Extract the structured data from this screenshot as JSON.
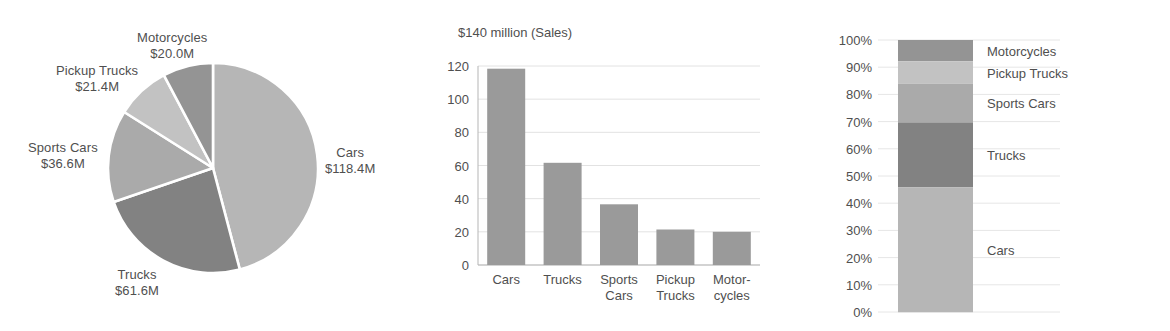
{
  "chart_data": [
    {
      "type": "pie",
      "name": "sales-by-category-pie",
      "title": "",
      "unit": "$M",
      "total": 258.0,
      "categories": [
        "Cars",
        "Trucks",
        "Sports Cars",
        "Pickup Trucks",
        "Motorcycles"
      ],
      "values": [
        118.4,
        61.6,
        36.6,
        21.4,
        20.0
      ],
      "labels": [
        {
          "name": "Cars",
          "value": "$118.4M",
          "color": "#b6b6b6"
        },
        {
          "name": "Trucks",
          "value": "$61.6M",
          "color": "#828282"
        },
        {
          "name": "Sports Cars",
          "value": "$36.6M",
          "color": "#aaaaaa"
        },
        {
          "name": "Pickup Trucks",
          "value": "$21.4M",
          "color": "#c2c2c2"
        },
        {
          "name": "Motorcycles",
          "value": "$20.0M",
          "color": "#949494"
        }
      ],
      "slice_separator_color": "#ffffff",
      "legend": "labels-outside"
    },
    {
      "type": "bar",
      "name": "sales-by-category-bar",
      "title": "$140 million (Sales)",
      "xlabel": "",
      "ylabel": "",
      "ylim": [
        0,
        120
      ],
      "yticks": [
        "0",
        "20",
        "40",
        "60",
        "80",
        "100",
        "120"
      ],
      "grid": true,
      "bar_color": "#9a9a9a",
      "categories": [
        "Cars",
        "Trucks",
        "Sports Cars",
        "Pickup Trucks",
        "Motorcycles"
      ],
      "category_lines": [
        [
          "Cars",
          ""
        ],
        [
          "Trucks",
          ""
        ],
        [
          "Sports",
          "Cars"
        ],
        [
          "Pickup",
          "Trucks"
        ],
        [
          "Motor-",
          "cycles"
        ]
      ],
      "values": [
        118.4,
        61.6,
        36.6,
        21.4,
        20.0
      ]
    },
    {
      "type": "bar",
      "name": "sales-share-stacked-bar",
      "subtype": "stacked-100",
      "title": "",
      "ylim": [
        0,
        100
      ],
      "yticks": [
        "100%",
        "90%",
        "80%",
        "70%",
        "60%",
        "50%",
        "40%",
        "30%",
        "20%",
        "10%",
        "0%"
      ],
      "grid": true,
      "categories": [
        "Cars",
        "Trucks",
        "Sports Cars",
        "Pickup Trucks",
        "Motorcycles"
      ],
      "values": [
        45.9,
        23.9,
        14.2,
        8.3,
        7.8
      ],
      "segments": [
        {
          "name": "Motorcycles",
          "percent": 7.8,
          "color": "#949494"
        },
        {
          "name": "Pickup Trucks",
          "percent": 8.3,
          "color": "#c2c2c2"
        },
        {
          "name": "Sports Cars",
          "percent": 14.2,
          "color": "#aaaaaa"
        },
        {
          "name": "Trucks",
          "percent": 23.9,
          "color": "#828282"
        },
        {
          "name": "Cars",
          "percent": 45.9,
          "color": "#b6b6b6"
        }
      ]
    }
  ],
  "pie": {
    "labels": [
      {
        "id": "motorcycles",
        "line1": "Motorcycles",
        "line2": "$20.0M"
      },
      {
        "id": "pickup-trucks",
        "line1": "Pickup Trucks",
        "line2": "$21.4M"
      },
      {
        "id": "sports-cars",
        "line1": "Sports Cars",
        "line2": "$36.6M"
      },
      {
        "id": "cars",
        "line1": "Cars",
        "line2": "$118.4M"
      },
      {
        "id": "trucks",
        "line1": "Trucks",
        "line2": "$61.6M"
      }
    ]
  },
  "bar": {
    "title": "$140 million (Sales)"
  }
}
